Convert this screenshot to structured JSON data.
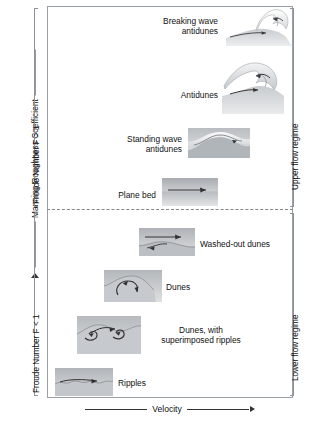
{
  "figure": {
    "y_axis_label": "Manning Roughness Coefficient",
    "x_axis_label": "Velocity"
  },
  "left_brackets": [
    {
      "id": "froude-greater",
      "label": "Froude Number F > 1"
    },
    {
      "id": "froude-less",
      "label": "Froude Number F < 1"
    }
  ],
  "right_brackets": [
    {
      "id": "upper-regime",
      "label": "Upper flow regime"
    },
    {
      "id": "lower-regime",
      "label": "Lower flow regime"
    }
  ],
  "bedforms": [
    {
      "id": "breaking-wave-antidunes",
      "label": "Breaking wave\nantidunes"
    },
    {
      "id": "antidunes",
      "label": "Antidunes"
    },
    {
      "id": "standing-wave-antidunes",
      "label": "Standing wave\nantidunes"
    },
    {
      "id": "plane-bed",
      "label": "Plane bed"
    },
    {
      "id": "washed-out-dunes",
      "label": "Washed-out dunes"
    },
    {
      "id": "dunes",
      "label": "Dunes"
    },
    {
      "id": "dunes-superimposed-ripples",
      "label": "Dunes, with\nsuperimposed ripples"
    },
    {
      "id": "ripples",
      "label": "Ripples"
    }
  ],
  "colors": {
    "frame_line": "#9aa0a6",
    "divider_line": "#7f868c",
    "bed_light": "#d9dbdd",
    "bed_mid": "#c2c6ca",
    "bed_dark": "#a8adb2",
    "text": "#111111",
    "arrow": "#2b2b2b"
  }
}
